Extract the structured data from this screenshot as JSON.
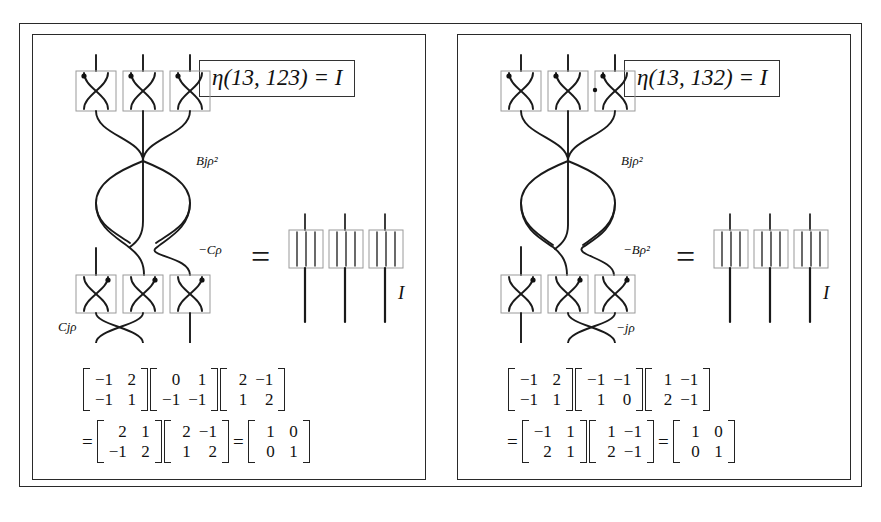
{
  "figure": {
    "kind": "braid-diagram-with-matrix-identities",
    "panels": [
      {
        "id": "left",
        "header": "η(13, 123) = I",
        "header_eta": "η",
        "header_args": "(13, 123)",
        "header_equals": "=",
        "header_result": "I",
        "equals_sign": "=",
        "identity_label": "I",
        "crossing_labels": {
          "upper": "Bjρ²",
          "middle": "−Cρ",
          "lower": "Cjρ"
        },
        "matrix_line_1": {
          "lead": "",
          "matrices": [
            {
              "rows": [
                [
                  "−1",
                  "2"
                ],
                [
                  "−1",
                  "1"
                ]
              ]
            },
            {
              "rows": [
                [
                  "0",
                  "1"
                ],
                [
                  "−1",
                  "−1"
                ]
              ]
            },
            {
              "rows": [
                [
                  "2",
                  "−1"
                ],
                [
                  "1",
                  "2"
                ]
              ]
            }
          ]
        },
        "matrix_line_2": {
          "lead": "=",
          "matrices": [
            {
              "rows": [
                [
                  "2",
                  "1"
                ],
                [
                  "−1",
                  "2"
                ]
              ]
            },
            {
              "rows": [
                [
                  "2",
                  "−1"
                ],
                [
                  "1",
                  "2"
                ]
              ]
            },
            {
              "rows": [
                [
                  "1",
                  "0"
                ],
                [
                  "0",
                  "1"
                ]
              ]
            }
          ],
          "inter_equals": "="
        }
      },
      {
        "id": "right",
        "header": "η(13, 132) = I",
        "header_eta": "η",
        "header_args": "(13, 132)",
        "header_equals": "=",
        "header_result": "I",
        "equals_sign": "=",
        "identity_label": "I",
        "crossing_labels": {
          "upper": "Bjρ²",
          "middle": "−Bρ²",
          "lower": "−jρ"
        },
        "matrix_line_1": {
          "lead": "",
          "matrices": [
            {
              "rows": [
                [
                  "−1",
                  "2"
                ],
                [
                  "−1",
                  "1"
                ]
              ]
            },
            {
              "rows": [
                [
                  "−1",
                  "−1"
                ],
                [
                  "1",
                  "0"
                ]
              ]
            },
            {
              "rows": [
                [
                  "1",
                  "−1"
                ],
                [
                  "2",
                  "−1"
                ]
              ]
            }
          ]
        },
        "matrix_line_2": {
          "lead": "=",
          "matrices": [
            {
              "rows": [
                [
                  "−1",
                  "1"
                ],
                [
                  "2",
                  "1"
                ]
              ]
            },
            {
              "rows": [
                [
                  "1",
                  "−1"
                ],
                [
                  "2",
                  "−1"
                ]
              ]
            },
            {
              "rows": [
                [
                  "1",
                  "0"
                ],
                [
                  "0",
                  "1"
                ]
              ]
            }
          ],
          "inter_equals": "="
        }
      }
    ],
    "colors": {
      "ink": "#111111",
      "frame": "#2a2a2a",
      "box_outline": "#9a9a9a",
      "background": "#ffffff"
    }
  }
}
